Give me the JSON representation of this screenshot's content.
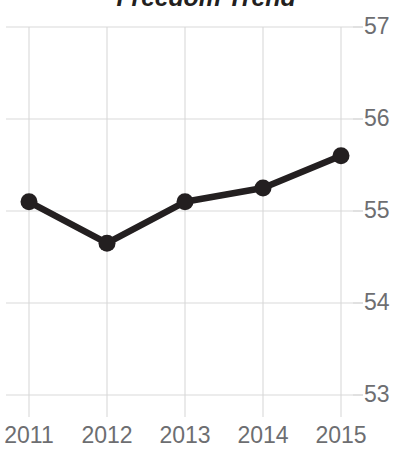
{
  "chart_data": {
    "type": "line",
    "title": "Freedom Trend",
    "xlabel": "",
    "ylabel": "",
    "categories": [
      "2011",
      "2012",
      "2013",
      "2014",
      "2015"
    ],
    "x": [
      2011,
      2012,
      2013,
      2014,
      2015
    ],
    "values": [
      55.1,
      54.65,
      55.1,
      55.25,
      55.6
    ],
    "series": [
      {
        "name": "Freedom Trend",
        "values": [
          55.1,
          54.65,
          55.1,
          55.25,
          55.6
        ]
      }
    ],
    "ylim": [
      53,
      57
    ],
    "yticks": [
      57,
      56,
      55,
      54,
      53
    ],
    "ytick_labels": [
      "57",
      "56",
      "55",
      "54",
      "53"
    ],
    "xtick_labels": [
      "2011",
      "2012",
      "2013",
      "2014",
      "2015"
    ],
    "grid": true,
    "legend": false,
    "legend_position": "none",
    "markers": true,
    "line_color": "#231f20",
    "marker_color": "#231f20",
    "grid_color": "#d9d9d9",
    "label_color": "#6d6e71",
    "title_color": "#231f20",
    "background_color": "#ffffff",
    "y_axis_position": "right",
    "annotations": []
  },
  "geometry": {
    "plot_left": 29,
    "plot_right": 341,
    "y_top_px": 27,
    "y_bottom_px": 395,
    "px_per_unit": 92
  }
}
